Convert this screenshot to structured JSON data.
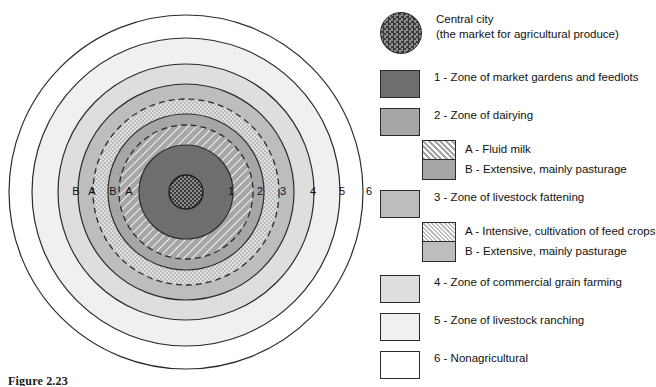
{
  "figure": {
    "caption": "Figure 2.23"
  },
  "diagram": {
    "center": {
      "cx": 186,
      "cy": 192
    },
    "ring_labels_right": [
      "1",
      "2",
      "3",
      "4",
      "5",
      "6"
    ],
    "ring_labels_left": [
      "B",
      "A",
      "B",
      "A"
    ],
    "label_y": 192,
    "label_x_right": [
      231,
      260,
      283,
      313,
      342,
      369
    ],
    "label_x_left": [
      76,
      92,
      113,
      129
    ],
    "rings": [
      {
        "name": "zone-6-nonagricultural",
        "r": 177,
        "fill": "#ffffff",
        "pattern": "none"
      },
      {
        "name": "zone-5-livestock-ranching",
        "r": 154,
        "fill": "#f0f0f0",
        "pattern": "none"
      },
      {
        "name": "zone-4-commercial-grain",
        "r": 128,
        "fill": "#dedede",
        "pattern": "none"
      },
      {
        "name": "zone-3b-extensive-pasturage",
        "r": 108,
        "fill": "#bdbdbd",
        "pattern": "none"
      },
      {
        "name": "zone-3a-intensive-feed-crops",
        "r": 93,
        "fill": "#bdbdbd",
        "pattern": "dots",
        "dashed": true
      },
      {
        "name": "zone-2b-extensive-pasturage",
        "r": 78,
        "fill": "#a6a6a6",
        "pattern": "none"
      },
      {
        "name": "zone-2a-fluid-milk",
        "r": 67,
        "fill": "#a6a6a6",
        "pattern": "hatch",
        "dashed": true
      },
      {
        "name": "zone-1-market-gardens",
        "r": 47,
        "fill": "#6e6e6e",
        "pattern": "none"
      },
      {
        "name": "central-city",
        "r": 17,
        "fill": "#3a3a3a",
        "pattern": "checker"
      }
    ]
  },
  "legend": {
    "entries": [
      {
        "key": "central-city",
        "swatch": "circle",
        "swatch_fill": "#3a3a3a",
        "swatch_pattern": "checker",
        "line1": "Central city",
        "line2": "(the market for agricultural produce)"
      },
      {
        "key": "zone-1",
        "swatch": "rect",
        "swatch_fill": "#6e6e6e",
        "swatch_pattern": "none",
        "line1": "1 - Zone of market gardens and feedlots"
      },
      {
        "key": "zone-2",
        "swatch": "rect",
        "swatch_fill": "#a6a6a6",
        "swatch_pattern": "none",
        "line1": "2 - Zone of dairying"
      },
      {
        "key": "zone-2-sub",
        "swatch": "sub",
        "swatch_fill": "#a6a6a6",
        "sub_a_pattern": "hatch",
        "sub_b_pattern": "none",
        "line1": "A - Fluid milk",
        "line2": "B - Extensive, mainly pasturage"
      },
      {
        "key": "zone-3",
        "swatch": "rect",
        "swatch_fill": "#bdbdbd",
        "swatch_pattern": "none",
        "line1": "3 - Zone of livestock fattening"
      },
      {
        "key": "zone-3-sub",
        "swatch": "sub",
        "swatch_fill": "#bdbdbd",
        "sub_a_pattern": "dots",
        "sub_b_pattern": "none",
        "line1": "A - Intensive, cultivation of feed crops",
        "line2": "B - Extensive, mainly pasturage"
      },
      {
        "key": "zone-4",
        "swatch": "rect",
        "swatch_fill": "#dedede",
        "swatch_pattern": "none",
        "line1": "4 - Zone of commercial grain farming"
      },
      {
        "key": "zone-5",
        "swatch": "rect",
        "swatch_fill": "#f0f0f0",
        "swatch_pattern": "none",
        "line1": "5 - Zone of livestock ranching"
      },
      {
        "key": "zone-6",
        "swatch": "rect",
        "swatch_fill": "#ffffff",
        "swatch_pattern": "none",
        "line1": "6 - Nonagricultural"
      }
    ]
  },
  "colors": {
    "stroke": "#2b2b2b",
    "text": "#111111",
    "city": "#3a3a3a",
    "zone1": "#6e6e6e",
    "zone2": "#a6a6a6",
    "zone3": "#bdbdbd",
    "zone4": "#dedede",
    "zone5": "#f0f0f0",
    "zone6": "#ffffff"
  }
}
